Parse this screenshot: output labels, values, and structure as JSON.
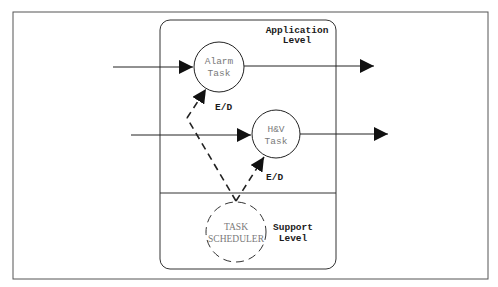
{
  "diagram": {
    "regions": {
      "application": {
        "label_line1": "Application",
        "label_line2": "Level"
      },
      "support": {
        "label_line1": "Support",
        "label_line2": "Level"
      }
    },
    "nodes": {
      "alarm_task": {
        "line1": "Alarm",
        "line2": "Task"
      },
      "hv_task": {
        "line1": "H&V",
        "line2": "Task"
      },
      "task_scheduler": {
        "line1": "TASK",
        "line2": "SCHEDULER"
      }
    },
    "edges": {
      "alarm_enable": {
        "label": "E/D"
      },
      "hv_enable": {
        "label": "E/D"
      }
    },
    "colors": {
      "stroke": "#222222",
      "node_text": "#7a7a7a",
      "frame": "#555555"
    }
  }
}
